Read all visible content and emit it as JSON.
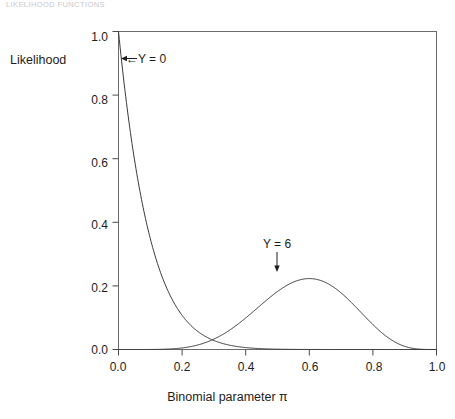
{
  "page": {
    "running_head": "LIKELIHOOD FUNCTIONS"
  },
  "axis": {
    "y_title": "Likelihood",
    "x_title_text": "Binomial parameter ",
    "x_title_symbol": "π",
    "y_ticks": [
      "0.0",
      "0.2",
      "0.4",
      "0.6",
      "0.8",
      "1.0"
    ],
    "x_ticks": [
      "0.0",
      "0.2",
      "0.4",
      "0.6",
      "0.8",
      "1.0"
    ]
  },
  "annotations": {
    "y0": "←Y = 0",
    "y6": "Y = 6"
  },
  "chart_data": {
    "type": "line",
    "title": "",
    "subtitle": "",
    "xlabel": "Binomial parameter π",
    "ylabel": "Likelihood",
    "xlim": [
      0.0,
      1.0
    ],
    "ylim": [
      0.0,
      1.0
    ],
    "grid": false,
    "legend": "none",
    "frame": "box",
    "annotations": [
      {
        "text": "←Y = 0",
        "x": 0.03,
        "y": 0.92,
        "arrow": "left",
        "points_to_series": "Y = 0"
      },
      {
        "text": "Y = 6",
        "x": 0.47,
        "y": 0.37,
        "arrow": "down",
        "points_to_series": "Y = 6"
      }
    ],
    "x": [
      0.0,
      0.05,
      0.1,
      0.15,
      0.2,
      0.25,
      0.3,
      0.35,
      0.4,
      0.45,
      0.5,
      0.55,
      0.6,
      0.65,
      0.7,
      0.75,
      0.8,
      0.85,
      0.9,
      0.95,
      1.0
    ],
    "series": [
      {
        "name": "Y = 0",
        "formula": "(1-pi)^10",
        "values": [
          1.0,
          0.599,
          0.349,
          0.197,
          0.107,
          0.056,
          0.028,
          0.013,
          0.006,
          0.003,
          0.001,
          0.0,
          0.0,
          0.0,
          0.0,
          0.0,
          0.0,
          0.0,
          0.0,
          0.0,
          0.0
        ]
      },
      {
        "name": "Y = 6",
        "formula": "210*pi^6*(1-pi)^4 scaled to max 0.256",
        "values": [
          0.0,
          0.0,
          0.0,
          0.002,
          0.007,
          0.016,
          0.033,
          0.059,
          0.092,
          0.129,
          0.164,
          0.195,
          0.216,
          0.223,
          0.213,
          0.184,
          0.139,
          0.087,
          0.037,
          0.006,
          0.0
        ]
      }
    ]
  }
}
